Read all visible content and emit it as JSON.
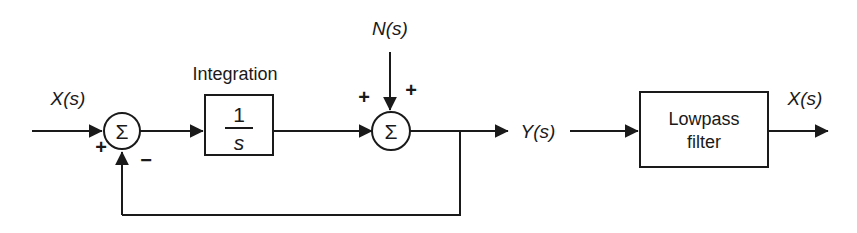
{
  "diagram": {
    "colors": {
      "stroke": "#1a1a1a",
      "background": "#ffffff"
    },
    "signals": {
      "input_label": "X(s)",
      "noise_label": "N(s)",
      "mid_output_label": "Y(s)",
      "output_label": "X(s)"
    },
    "blocks": {
      "integrator": {
        "caption": "Integration",
        "numerator": "1",
        "denominator": "s"
      },
      "lowpass": {
        "line1": "Lowpass",
        "line2": "filter"
      }
    },
    "summers": {
      "first": {
        "symbol": "Σ",
        "sign_input": "+",
        "sign_feedback": "−"
      },
      "second": {
        "symbol": "Σ",
        "sign_left": "+",
        "sign_top": "+"
      }
    }
  }
}
